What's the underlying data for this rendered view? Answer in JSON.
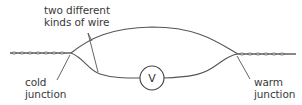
{
  "diagram": {
    "labels": {
      "wires_line1": "two different",
      "wires_line2": "kinds of wire",
      "cold_line1": "cold",
      "cold_line2": "junction",
      "warm_line1": "warm",
      "warm_line2": "junction"
    },
    "meter": {
      "symbol": "V",
      "icon": "voltmeter-icon"
    },
    "colors": {
      "line": "#555555",
      "text": "#3a3a3a",
      "background": "#ffffff"
    }
  }
}
